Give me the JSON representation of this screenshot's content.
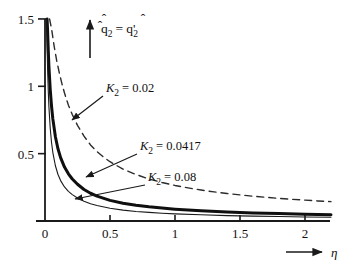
{
  "chart_data": {
    "type": "line",
    "title": "",
    "xlabel": "η",
    "ylabel": "q̂2 = q̂'2",
    "xlim": [
      0,
      2.2
    ],
    "ylim": [
      0,
      1.5
    ],
    "xticks": [
      0,
      0.5,
      1,
      1.5,
      2
    ],
    "xtick_labels": [
      "0",
      "0.5",
      "1",
      "1.5",
      "2"
    ],
    "yticks": [
      0,
      0.5,
      1,
      1.5
    ],
    "ytick_labels": [
      "0",
      "0.5",
      "1",
      "1.5"
    ],
    "grid": false,
    "legend_position": "inline-annotations",
    "series": [
      {
        "name": "κ2 = 0.02",
        "style": "dashed",
        "linewidth": 1.4,
        "color": "#2b2b2b",
        "x": [
          0.035,
          0.05,
          0.07,
          0.09,
          0.11,
          0.13,
          0.15,
          0.18,
          0.21,
          0.25,
          0.3,
          0.35,
          0.4,
          0.45,
          0.5,
          0.6,
          0.7,
          0.8,
          0.9,
          1.0,
          1.1,
          1.2,
          1.3,
          1.4,
          1.5,
          1.6,
          1.7,
          1.8,
          1.9,
          2.0,
          2.1,
          2.2
        ],
        "y": [
          1.5,
          1.43,
          1.3,
          1.19,
          1.1,
          1.02,
          0.95,
          0.86,
          0.79,
          0.71,
          0.63,
          0.565,
          0.515,
          0.475,
          0.44,
          0.385,
          0.345,
          0.312,
          0.286,
          0.264,
          0.246,
          0.23,
          0.216,
          0.204,
          0.194,
          0.184,
          0.176,
          0.168,
          0.161,
          0.155,
          0.149,
          0.144
        ]
      },
      {
        "name": "κ2 = 0.0417",
        "style": "solid-thick",
        "linewidth": 3.0,
        "color": "#0f0f0f",
        "x": [
          0.016,
          0.02,
          0.025,
          0.03,
          0.04,
          0.05,
          0.06,
          0.08,
          0.1,
          0.12,
          0.15,
          0.18,
          0.21,
          0.25,
          0.3,
          0.35,
          0.4,
          0.5,
          0.6,
          0.7,
          0.8,
          0.9,
          1.0,
          1.2,
          1.4,
          1.6,
          1.8,
          2.0,
          2.2
        ],
        "y": [
          1.5,
          1.41,
          1.27,
          1.15,
          0.98,
          0.855,
          0.76,
          0.625,
          0.535,
          0.47,
          0.4,
          0.35,
          0.312,
          0.273,
          0.234,
          0.206,
          0.185,
          0.153,
          0.132,
          0.117,
          0.105,
          0.096,
          0.088,
          0.076,
          0.067,
          0.06,
          0.055,
          0.05,
          0.047
        ]
      },
      {
        "name": "κ2 = 0.08",
        "style": "solid-thin",
        "linewidth": 1.1,
        "color": "#1a1a1a",
        "x": [
          0.012,
          0.015,
          0.02,
          0.025,
          0.03,
          0.04,
          0.05,
          0.06,
          0.08,
          0.1,
          0.12,
          0.15,
          0.18,
          0.21,
          0.25,
          0.3,
          0.35,
          0.4,
          0.5,
          0.6,
          0.7,
          0.8,
          0.9,
          1.0,
          1.2,
          1.4,
          1.6,
          1.8,
          2.0,
          2.2
        ],
        "y": [
          1.5,
          1.36,
          1.13,
          0.97,
          0.85,
          0.69,
          0.585,
          0.51,
          0.41,
          0.345,
          0.3,
          0.253,
          0.22,
          0.196,
          0.171,
          0.146,
          0.128,
          0.115,
          0.095,
          0.081,
          0.071,
          0.064,
          0.058,
          0.053,
          0.046,
          0.04,
          0.036,
          0.033,
          0.03,
          0.028
        ]
      }
    ],
    "annotations": [
      {
        "id": "ann-kappa-002",
        "text": "κ2 = 0.02",
        "text_main": "= 0.02",
        "symbol": "Κ",
        "subscript": "2",
        "label_x": 106,
        "label_y": 92,
        "arrow_from_x": 103,
        "arrow_from_y": 96,
        "arrow_to_x": 72,
        "arrow_to_y": 120
      },
      {
        "id": "ann-kappa-00417",
        "text": "κ2 = 0.0417",
        "text_main": "= 0.0417",
        "symbol": "Κ",
        "subscript": "2",
        "label_x": 140,
        "label_y": 150,
        "arrow_from_x": 137,
        "arrow_from_y": 154,
        "arrow_to_x": 86,
        "arrow_to_y": 177
      },
      {
        "id": "ann-kappa-008",
        "text": "κ2 = 0.08",
        "text_main": "= 0.08",
        "symbol": "Κ",
        "subscript": "2",
        "label_x": 148,
        "label_y": 181,
        "arrow_from_x": 145,
        "arrow_from_y": 185,
        "arrow_to_x": 75,
        "arrow_to_y": 199
      }
    ],
    "y_axis_arrow": {
      "label_q": "q",
      "label_sub": "2",
      "label_eq": "=",
      "label_q2": "q",
      "label_sub2": "2",
      "label_prime": "'",
      "hat": "̂"
    },
    "x_axis_arrow": {
      "label": "η"
    }
  },
  "colors": {
    "axis": "#1a1a1a",
    "dashed_series": "#2b2b2b",
    "thick_series": "#0f0f0f",
    "thin_series": "#1a1a1a",
    "background": "#ffffff",
    "text": "#111111"
  }
}
